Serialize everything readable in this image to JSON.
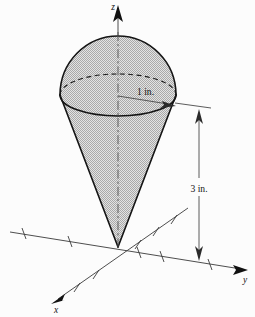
{
  "figure": {
    "background_color": "#fcfcfc",
    "fill_color": "#c9c9c9",
    "outline_color": "#141414",
    "axis_color": "#3a3a3a"
  },
  "axes": {
    "z_label": "z",
    "y_label": "y",
    "x_label": "x",
    "origin": {
      "x": 118,
      "y": 247
    },
    "z_tip": {
      "x": 118,
      "y": 8
    },
    "y_tip": {
      "x": 247,
      "y": 270
    },
    "x_tip": {
      "x": 52,
      "y": 303
    },
    "y_tick_count": 6,
    "x_tick_count": 6
  },
  "solid": {
    "type": "cone-with-spherical-cap",
    "apex": {
      "x": 118,
      "y": 247
    },
    "rim_center": {
      "x": 118,
      "y": 95
    },
    "rim_radius_x": 58,
    "rim_radius_y": 21,
    "cap_top": {
      "x": 118,
      "y": 36
    }
  },
  "dimensions": [
    {
      "name": "radius",
      "label": "1 in.",
      "value": 1,
      "unit": "in.",
      "label_x": 136,
      "label_y": 95,
      "from": {
        "x": 118,
        "y": 96
      },
      "to": {
        "x": 173,
        "y": 106
      }
    },
    {
      "name": "height",
      "label": "3 in.",
      "value": 3,
      "unit": "in.",
      "label_x": 196,
      "label_y": 191,
      "from": {
        "x": 199,
        "y": 112
      },
      "to": {
        "x": 199,
        "y": 258
      }
    }
  ]
}
